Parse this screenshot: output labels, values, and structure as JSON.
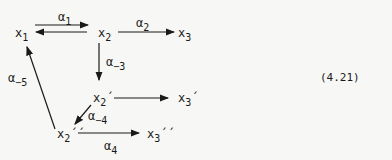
{
  "nodes": {
    "x1": {
      "base": "x",
      "sub": "1"
    },
    "x2": {
      "base": "x",
      "sub": "2"
    },
    "x3": {
      "base": "x",
      "sub": "3"
    },
    "x2p": {
      "base": "x",
      "sub": "2",
      "prime": "´"
    },
    "x3p": {
      "base": "x",
      "sub": "3",
      "prime": "´"
    },
    "x2pp": {
      "base": "x",
      "sub": "2",
      "prime": "´´"
    },
    "x3pp": {
      "base": "x",
      "sub": "3",
      "prime": "´´"
    }
  },
  "edges": {
    "a1": {
      "base": "α",
      "sub": "1"
    },
    "a2": {
      "base": "α",
      "sub": "2"
    },
    "am3": {
      "base": "α",
      "sub": "−3"
    },
    "am4": {
      "base": "α",
      "sub": "−4"
    },
    "am5": {
      "base": "α",
      "sub": "−5"
    },
    "a4": {
      "base": "α",
      "sub": "4"
    }
  },
  "equation_number": "(4.21)"
}
